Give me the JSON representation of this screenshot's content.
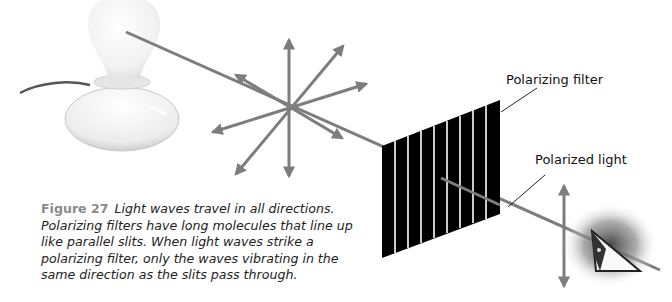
{
  "labels": {
    "polarizing_filter": "Polarizing filter",
    "polarized_light": "Polarized light"
  },
  "caption": {
    "figure": "Figure 27",
    "text": "Light waves travel in all directions. Polarizing filters have long molecules that line up like parallel slits. When light waves strike a polarizing filter, only the waves vibrating in the same direction as the slits pass through."
  },
  "colors": {
    "ray": "#7d7d7d",
    "filter": "#000000",
    "bulb": "#f2f2f2",
    "leader": "#222222"
  },
  "elements": {
    "light_source": "light-bulb-lamp",
    "unpolarized_waves": "star-of-arrows",
    "filter_slits": 9,
    "polarized_wave": "vertical-double-arrow",
    "observer": "eye"
  }
}
